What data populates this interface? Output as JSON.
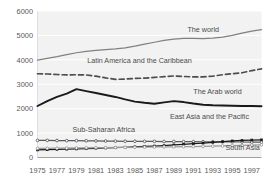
{
  "chart_data": {
    "type": "line",
    "title": "",
    "subtitle": "",
    "xlabel": "",
    "ylabel": "",
    "xlim": [
      1975,
      1998
    ],
    "ylim": [
      0,
      6000
    ],
    "grid": true,
    "legend_position": "inline-labels",
    "x": [
      1975,
      1976,
      1977,
      1978,
      1979,
      1980,
      1981,
      1982,
      1983,
      1984,
      1985,
      1986,
      1987,
      1988,
      1989,
      1990,
      1991,
      1992,
      1993,
      1994,
      1995,
      1996,
      1997,
      1998
    ],
    "xticks": [
      "1975",
      "1977",
      "1979",
      "1981",
      "1983",
      "1985",
      "1987",
      "1989",
      "1991",
      "1993",
      "1995",
      "1997"
    ],
    "yticks": [
      "0",
      "1000",
      "2000",
      "3000",
      "4000",
      "5000",
      "6000"
    ],
    "series": [
      {
        "name": "The world",
        "label": "The world",
        "color": "#808080",
        "style": "solid",
        "marker": "none",
        "label_x": 1990.4,
        "label_y": 5130,
        "values": [
          3990,
          4060,
          4130,
          4210,
          4290,
          4350,
          4390,
          4420,
          4450,
          4490,
          4560,
          4640,
          4720,
          4800,
          4850,
          4880,
          4880,
          4870,
          4890,
          4930,
          5000,
          5090,
          5180,
          5240
        ]
      },
      {
        "name": "Latin America and the Caribbean",
        "label": "Latin America and the Caribbean",
        "color": "#4d4d4d",
        "style": "dashed",
        "marker": "none",
        "label_x": 1980.1,
        "label_y": 3880,
        "values": [
          3430,
          3420,
          3400,
          3380,
          3390,
          3380,
          3330,
          3260,
          3200,
          3210,
          3240,
          3250,
          3280,
          3310,
          3340,
          3320,
          3300,
          3300,
          3330,
          3390,
          3430,
          3470,
          3560,
          3630
        ]
      },
      {
        "name": "The Arab world",
        "label": "The Arab world",
        "color": "#1a1a1a",
        "style": "solid",
        "marker": "none",
        "label_x": 1991.0,
        "label_y": 2590,
        "values": [
          2110,
          2310,
          2480,
          2620,
          2800,
          2720,
          2640,
          2560,
          2480,
          2380,
          2290,
          2240,
          2200,
          2260,
          2310,
          2270,
          2210,
          2160,
          2140,
          2130,
          2120,
          2110,
          2110,
          2100
        ]
      },
      {
        "name": "Sub-Saharan Africa",
        "label": "Sub-Saharan Africa",
        "color": "#5a5a5a",
        "style": "solid",
        "marker": "circle",
        "label_x": 1978.6,
        "label_y": 1030,
        "values": [
          700,
          700,
          695,
          690,
          690,
          685,
          680,
          675,
          670,
          665,
          665,
          660,
          660,
          655,
          655,
          650,
          650,
          645,
          645,
          640,
          640,
          635,
          630,
          625
        ]
      },
      {
        "name": "East Asia and the Pacific",
        "label": "East Asia and the Pacific",
        "color": "#1a1a1a",
        "style": "solid",
        "marker": "square",
        "label_x": 1988.6,
        "label_y": 1560,
        "values": [
          310,
          320,
          330,
          340,
          350,
          360,
          375,
          390,
          405,
          420,
          440,
          455,
          470,
          490,
          515,
          540,
          565,
          590,
          620,
          650,
          680,
          700,
          715,
          725
        ]
      },
      {
        "name": "South Asia",
        "label": "South Asia",
        "color": "#9a9a9a",
        "style": "solid",
        "marker": "circle",
        "label_x": 1994.3,
        "label_y": 310,
        "values": [
          370,
          375,
          380,
          385,
          390,
          395,
          400,
          405,
          410,
          415,
          420,
          425,
          430,
          435,
          440,
          445,
          450,
          455,
          465,
          475,
          485,
          495,
          510,
          520
        ]
      }
    ]
  }
}
